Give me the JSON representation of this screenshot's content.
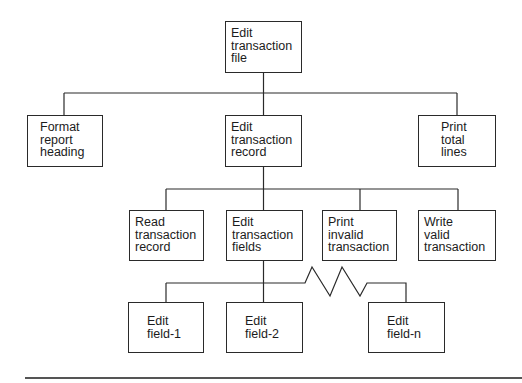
{
  "diagram": {
    "type": "hierarchy-chart",
    "root": {
      "id": "edit-transaction-file",
      "lines": [
        "Edit",
        "transaction",
        "file"
      ]
    },
    "level1": [
      {
        "id": "format-report-heading",
        "lines": [
          "Format",
          "report",
          "heading"
        ]
      },
      {
        "id": "edit-transaction-record",
        "lines": [
          "Edit",
          "transaction",
          "record"
        ]
      },
      {
        "id": "print-total-lines",
        "lines": [
          "Print",
          "total",
          "lines"
        ]
      }
    ],
    "level2": [
      {
        "id": "read-transaction-record",
        "lines": [
          "Read",
          "transaction",
          "record"
        ]
      },
      {
        "id": "edit-transaction-fields",
        "lines": [
          "Edit",
          "transaction",
          "fields"
        ]
      },
      {
        "id": "print-invalid-transaction",
        "lines": [
          "Print",
          "invalid",
          "transaction"
        ]
      },
      {
        "id": "write-valid-transaction",
        "lines": [
          "Write",
          "valid",
          "transaction"
        ]
      }
    ],
    "level3": [
      {
        "id": "edit-field-1",
        "lines": [
          "Edit",
          "field-1"
        ]
      },
      {
        "id": "edit-field-2",
        "lines": [
          "Edit",
          "field-2"
        ]
      },
      {
        "id": "edit-field-n",
        "lines": [
          "Edit",
          "field-n"
        ]
      }
    ],
    "colors": {
      "line": "#2a2a2a",
      "text": "#1c1c1c",
      "background": "#ffffff"
    }
  }
}
